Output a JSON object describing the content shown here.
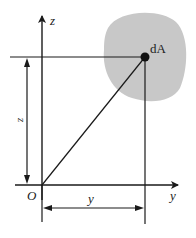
{
  "diagram": {
    "labels": {
      "z_axis": "z",
      "y_axis": "y",
      "origin": "O",
      "area_element": "dA",
      "z_dimension": "z",
      "y_dimension": "y"
    },
    "colors": {
      "region_fill": "#c8c8c8",
      "line": "#1a1a1a"
    }
  }
}
